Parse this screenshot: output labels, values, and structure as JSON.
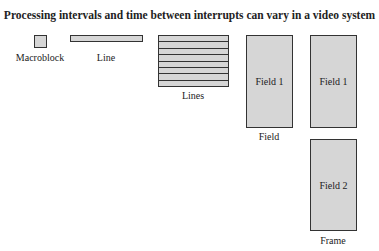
{
  "title": "Processing intervals and time between interrupts can vary in a video system",
  "items": {
    "macroblock": {
      "label": "Macroblock"
    },
    "line": {
      "label": "Line"
    },
    "lines": {
      "label": "Lines",
      "stripe_count": 8
    },
    "field": {
      "label": "Field",
      "box_text": "Field 1"
    },
    "frame": {
      "label": "Frame",
      "box_top_text": "Field 1",
      "box_bottom_text": "Field 2"
    }
  },
  "colors": {
    "fill": "#d6d6d6",
    "stroke": "#333333"
  }
}
